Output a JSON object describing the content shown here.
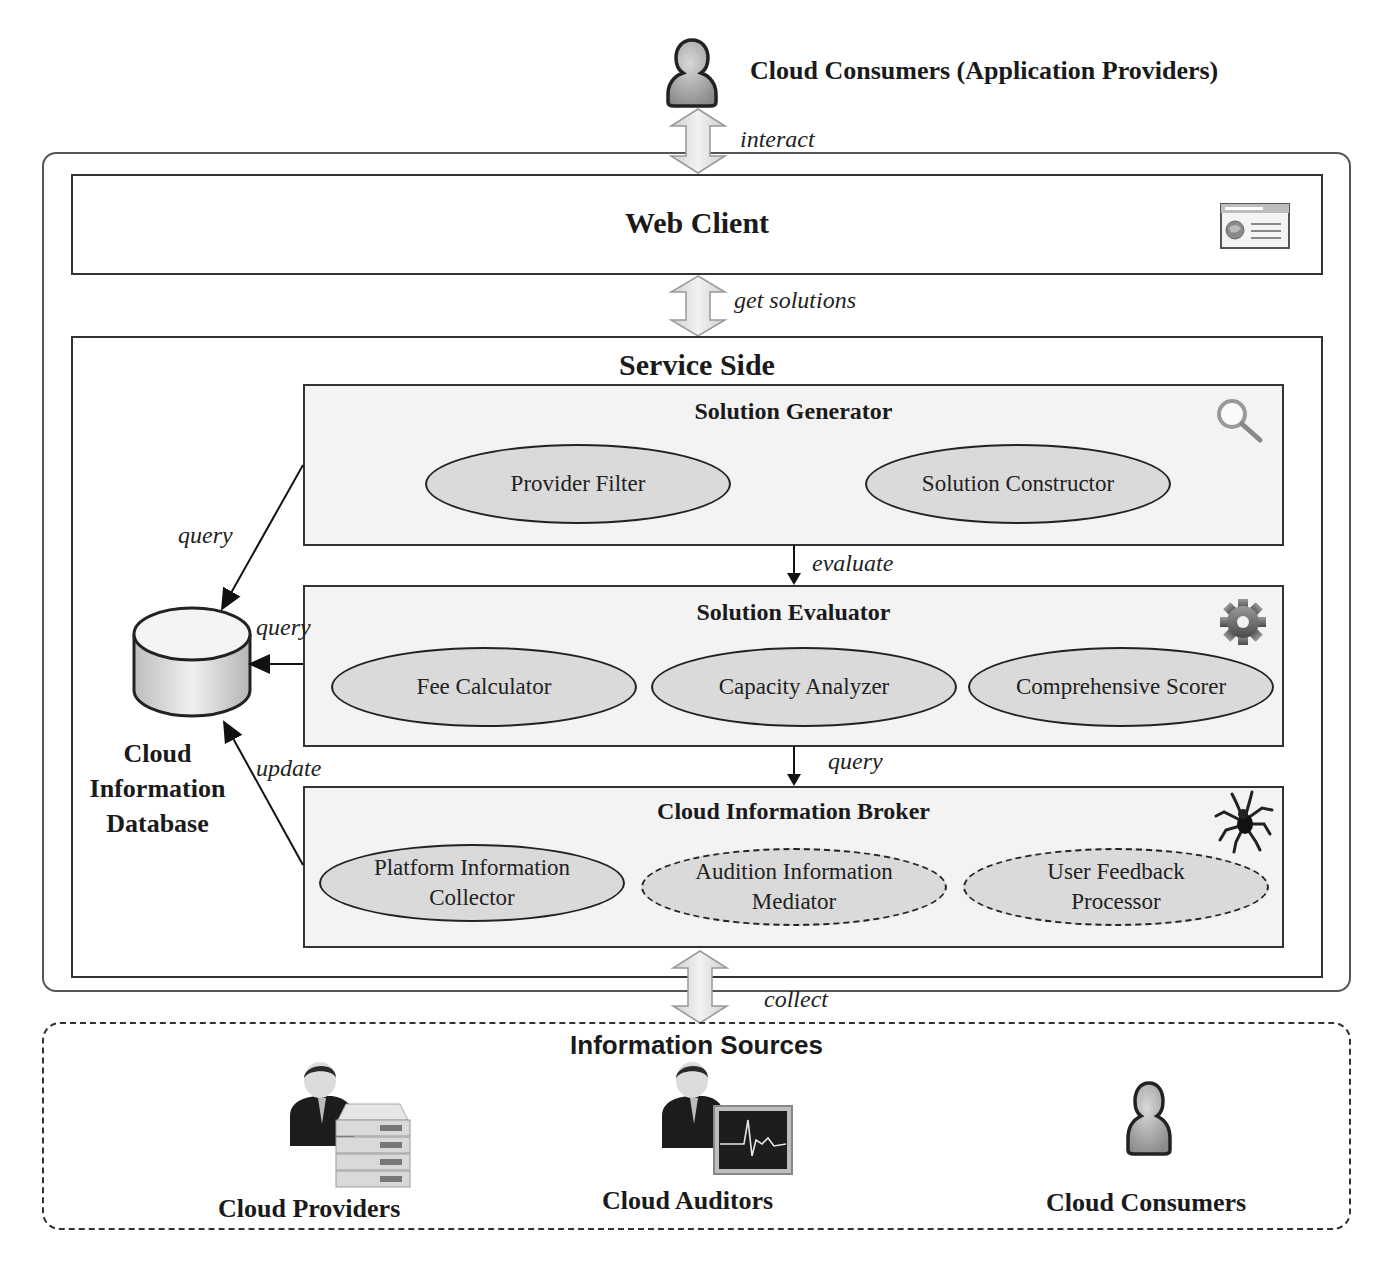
{
  "top_actor": {
    "label": "Cloud Consumers (Application Providers)",
    "icon": "user-icon"
  },
  "connectors": {
    "interact": "interact",
    "get_solutions": "get solutions",
    "evaluate": "evaluate",
    "query_broker": "query",
    "collect": "collect",
    "query_generator": "query",
    "query_evaluator": "query",
    "update_broker": "update"
  },
  "web_client": {
    "title": "Web Client",
    "icon": "browser-window-icon"
  },
  "service_side": {
    "title": "Service Side",
    "database": {
      "label_lines": [
        "Cloud",
        "Information",
        "Database"
      ],
      "icon": "database-cylinder-icon"
    },
    "modules": [
      {
        "title": "Solution Generator",
        "icon": "magnifier-icon",
        "components": [
          {
            "label": "Provider Filter",
            "style": "solid"
          },
          {
            "label": "Solution Constructor",
            "style": "solid"
          }
        ]
      },
      {
        "title": "Solution Evaluator",
        "icon": "gear-icon",
        "components": [
          {
            "label": "Fee Calculator",
            "style": "solid"
          },
          {
            "label": "Capacity Analyzer",
            "style": "solid"
          },
          {
            "label": "Comprehensive Scorer",
            "style": "solid"
          }
        ]
      },
      {
        "title": "Cloud Information Broker",
        "icon": "spider-icon",
        "components": [
          {
            "label_lines": [
              "Platform Information",
              "Collector"
            ],
            "style": "solid"
          },
          {
            "label_lines": [
              "Audition Information",
              "Mediator"
            ],
            "style": "dashed"
          },
          {
            "label_lines": [
              "User Feedback",
              "Processor"
            ],
            "style": "dashed"
          }
        ]
      }
    ]
  },
  "information_sources": {
    "title": "Information Sources",
    "actors": [
      {
        "label": "Cloud Providers",
        "icon": "businessman-server-icon"
      },
      {
        "label": "Cloud Auditors",
        "icon": "businessman-monitor-icon"
      },
      {
        "label": "Cloud Consumers",
        "icon": "user-icon"
      }
    ]
  },
  "colors": {
    "line": "#333333",
    "module_fill": "#f3f3f3",
    "ellipse_fill": "#dadada",
    "arrow_fill": "#e6e6e6"
  }
}
